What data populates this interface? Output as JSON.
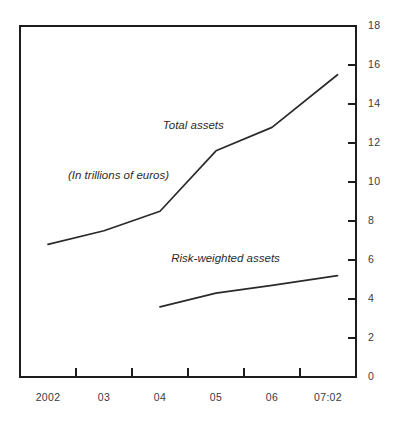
{
  "chart_data": {
    "type": "line",
    "title": "",
    "subtitle": "",
    "xlabel": "",
    "ylabel": "",
    "annotation_units": "(In trillions of euros)",
    "categories": [
      "2002",
      "03",
      "04",
      "05",
      "06",
      "07:02"
    ],
    "x": [
      2002,
      2003,
      2004,
      2005,
      2006,
      2007.17
    ],
    "xlim": [
      2001.5,
      2007.5
    ],
    "ylim": [
      0,
      18
    ],
    "ytick_labels": [
      "0",
      "2",
      "4",
      "6",
      "8",
      "10",
      "12",
      "14",
      "16",
      "18"
    ],
    "yticks": [
      0,
      2,
      4,
      6,
      8,
      10,
      12,
      14,
      16,
      18
    ],
    "grid": false,
    "legend_position": "inline-annotations",
    "series": [
      {
        "name": "Total assets",
        "label_x": 2004.05,
        "label_y": 12.7,
        "x": [
          2002,
          2003,
          2004,
          2005,
          2006,
          2007.17
        ],
        "values": [
          6.8,
          7.5,
          8.5,
          11.6,
          12.8,
          15.5
        ]
      },
      {
        "name": "Risk-weighted assets",
        "label_x": 2004.2,
        "label_y": 5.9,
        "x": [
          2004,
          2005,
          2006,
          2007.17
        ],
        "values": [
          3.6,
          4.3,
          4.7,
          5.2
        ]
      }
    ]
  },
  "axes": {
    "y_axis_side": "right",
    "x_axis_ticks_between_labels": true
  }
}
